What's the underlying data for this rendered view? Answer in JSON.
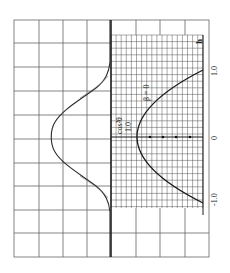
{
  "figure": {
    "type": "oscillograph-trace-on-grid",
    "orientation": "rotated -90deg",
    "colors": {
      "background": "#ffffff",
      "grid": "#555555",
      "trace": "#2a2a2a",
      "axis": "#1a1a1a"
    }
  },
  "chart_data": [
    {
      "type": "line",
      "title": "",
      "description": "Measured pulse profile trace on coarse grid (peaked, flat baseline on both sides)",
      "grid": {
        "columns": 8,
        "rows": 10,
        "on": true
      },
      "x": [
        -1.4,
        -1.2,
        -1.0,
        -0.8,
        -0.6,
        -0.4,
        -0.2,
        0.0,
        0.2,
        0.4,
        0.6,
        0.8,
        1.0,
        1.2,
        1.4
      ],
      "series": [
        {
          "name": "trace",
          "values": [
            0.0,
            0.0,
            0.02,
            0.12,
            0.38,
            0.68,
            0.92,
            1.0,
            0.92,
            0.68,
            0.38,
            0.12,
            0.02,
            0.0,
            0.0
          ]
        }
      ]
    },
    {
      "type": "line",
      "title": "",
      "xlabel": "h",
      "ylabel": "cos²θ",
      "annotation": "β = 0",
      "xticks": [
        "-1.0",
        "0",
        "1.0"
      ],
      "yticks": [
        "1.0"
      ],
      "xlim": [
        -1.0,
        1.0
      ],
      "ylim": [
        0,
        1.0
      ],
      "x": [
        -1.0,
        -0.75,
        -0.5,
        -0.25,
        0.0,
        0.25,
        0.5,
        0.75,
        1.0
      ],
      "series": [
        {
          "name": "β = 0",
          "values": [
            0.0,
            0.4375,
            0.75,
            0.9375,
            1.0,
            0.9375,
            0.75,
            0.4375,
            0.0
          ]
        }
      ]
    }
  ],
  "labels": {
    "h_axis": "h",
    "tick_pos": "1.0",
    "tick_zero": "0",
    "tick_neg": "-1.0",
    "y_label": "cos²θ",
    "y_tick": "1.0",
    "beta": "β = 0"
  }
}
